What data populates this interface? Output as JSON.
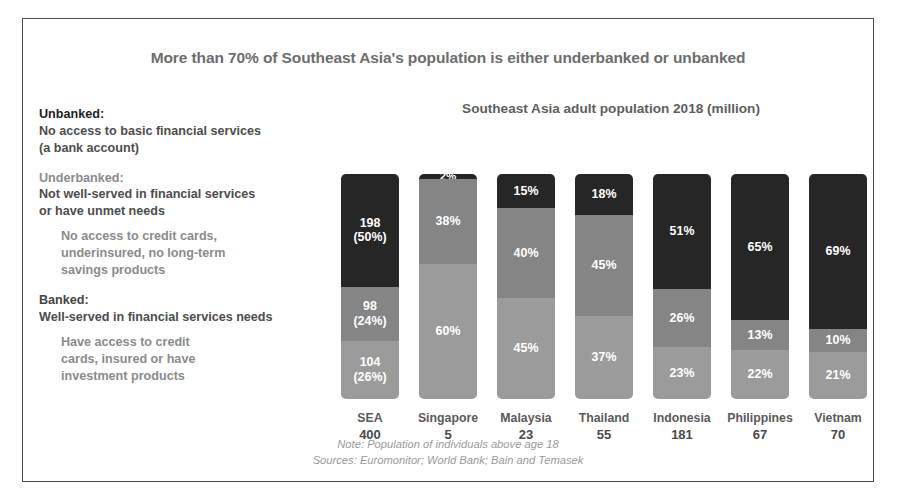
{
  "headline": "More than 70% of Southeast Asia's population is either underbanked or unbanked",
  "legend": {
    "unbanked": {
      "term": "Unbanked:",
      "desc": "No access to basic financial services\n(a bank account)"
    },
    "underbanked": {
      "term": "Underbanked:",
      "desc": "Not well-served in financial services\nor have unmet needs",
      "sub": "No access to credit cards,\nunderinsured, no long-term\nsavings products"
    },
    "banked": {
      "term": "Banked:",
      "desc": "Well-served in financial services needs",
      "sub": "Have access to credit\ncards, insured or have\ninvestment products"
    }
  },
  "footnote": {
    "note": "Note: Population of individuals above age 18",
    "sources": "Sources: Euromonitor; World Bank; Bain and Temasek"
  },
  "colors": {
    "unbanked": "#262626",
    "underbanked": "#858585",
    "banked": "#9b9b9b",
    "frame": "#4a4a4a",
    "headline_text": "#6d6d6d"
  },
  "chart_data": {
    "type": "bar",
    "title": "Southeast Asia adult population 2018 (million)",
    "subtype": "stacked-100-percent",
    "xlabel": "",
    "ylabel": "",
    "ylim": [
      0,
      100
    ],
    "grid": false,
    "legend_position": "left-external",
    "categories": [
      "SEA",
      "Singapore",
      "Malaysia",
      "Thailand",
      "Indonesia",
      "Philippines",
      "Vietnam"
    ],
    "population_millions": [
      400,
      5,
      23,
      55,
      181,
      67,
      70
    ],
    "series": [
      {
        "name": "Unbanked",
        "values": [
          50,
          2,
          15,
          18,
          51,
          65,
          69
        ]
      },
      {
        "name": "Underbanked",
        "values": [
          24,
          38,
          40,
          45,
          26,
          13,
          10
        ]
      },
      {
        "name": "Banked",
        "values": [
          26,
          60,
          45,
          37,
          23,
          22,
          21
        ]
      }
    ],
    "bar_labels": [
      {
        "category": "SEA",
        "unbanked": "198\n(50%)",
        "underbanked": "98\n(24%)",
        "banked": "104\n(26%)"
      },
      {
        "category": "Singapore",
        "unbanked": "2%",
        "underbanked": "38%",
        "banked": "60%"
      },
      {
        "category": "Malaysia",
        "unbanked": "15%",
        "underbanked": "40%",
        "banked": "45%"
      },
      {
        "category": "Thailand",
        "unbanked": "18%",
        "underbanked": "45%",
        "banked": "37%"
      },
      {
        "category": "Indonesia",
        "unbanked": "51%",
        "underbanked": "26%",
        "banked": "23%"
      },
      {
        "category": "Philippines",
        "unbanked": "65%",
        "underbanked": "13%",
        "banked": "22%"
      },
      {
        "category": "Vietnam",
        "unbanked": "69%",
        "underbanked": "10%",
        "banked": "21%"
      }
    ]
  }
}
